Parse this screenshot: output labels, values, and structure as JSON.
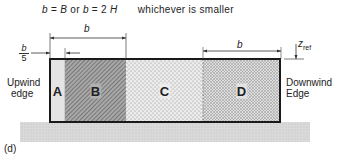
{
  "formula": {
    "part1_var": "b",
    "part1_eq": "=",
    "part1_val": "B",
    "or": "or",
    "part2_var": "b",
    "part2_eq": "=",
    "part2_coef": "2",
    "part2_val": "H",
    "note": "whichever is smaller"
  },
  "dimensions": {
    "left_b": "b",
    "right_b": "b",
    "fraction_num": "b",
    "fraction_den": "5",
    "zref_main": "z",
    "zref_sub": "ref"
  },
  "edges": {
    "upwind_line1": "Upwind",
    "upwind_line2": "edge",
    "downwind_line1": "Downwind",
    "downwind_line2": "Edge"
  },
  "regions": [
    {
      "id": "A",
      "label": "A",
      "fill": "#e2e2e2"
    },
    {
      "id": "B",
      "label": "B",
      "fill": "#8c8c8c"
    },
    {
      "id": "C",
      "label": "C",
      "fill": "#dcdcdc"
    },
    {
      "id": "D",
      "label": "D",
      "fill": "#c4c4c4"
    }
  ],
  "panel_label": "(d)",
  "colors": {
    "outline": "#1a1a1a",
    "ground": "#d8d8d8"
  }
}
